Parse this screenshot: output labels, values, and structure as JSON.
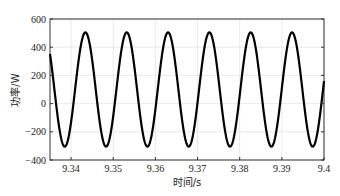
{
  "chart_data": {
    "type": "line",
    "title": "",
    "xlabel": "时间/s",
    "ylabel": "功率/W",
    "xlim": [
      9.335,
      9.4
    ],
    "ylim": [
      -400,
      600
    ],
    "xticks": [
      9.34,
      9.35,
      9.36,
      9.37,
      9.38,
      9.39,
      9.4
    ],
    "xtick_labels": [
      "9.34",
      "9.35",
      "9.36",
      "9.37",
      "9.38",
      "9.39",
      "9.4"
    ],
    "yticks": [
      600,
      400,
      200,
      0,
      -200,
      -400
    ],
    "ytick_labels": [
      "600",
      "400",
      "200",
      "0",
      "−200",
      "−400"
    ],
    "grid": true,
    "legend": null,
    "series": [
      {
        "name": "功率",
        "color": "#000000",
        "waveform": "sinusoid",
        "offset": 100,
        "amplitude": 405,
        "frequency_hz": 102,
        "first_peak_time": 9.3434,
        "peak_value": 505,
        "trough_value": -305,
        "peak_times": [
          9.3434,
          9.3532,
          9.363,
          9.3727,
          9.3825,
          9.3923
        ],
        "trough_times": [
          9.3384,
          9.3483,
          9.3581,
          9.3678,
          9.3776,
          9.3874,
          9.3972
        ],
        "start_value": 300
      }
    ]
  }
}
